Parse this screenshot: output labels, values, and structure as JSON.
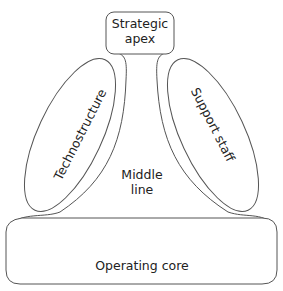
{
  "diagram": {
    "type": "organizational-structure",
    "parts": {
      "strategic_apex": {
        "line1": "Strategic",
        "line2": "apex"
      },
      "technostructure": {
        "label": "Technostructure"
      },
      "support_staff": {
        "label": "Support staff"
      },
      "middle_line": {
        "line1": "Middle",
        "line2": "line"
      },
      "operating_core": {
        "label": "Operating core"
      }
    },
    "colors": {
      "stroke": "#555555",
      "text": "#222222",
      "background": "#ffffff"
    }
  }
}
